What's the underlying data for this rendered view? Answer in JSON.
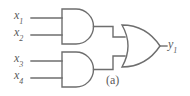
{
  "figure": {
    "caption": "(a)",
    "caption_x": 106,
    "caption_y": 74,
    "width": 190,
    "height": 96,
    "background_color": "#ffffff",
    "line_color": "#6e6e6e",
    "text_color": "#5a5a5a"
  },
  "inputs": [
    {
      "name": "x1",
      "base": "x",
      "subscript": "1",
      "x": 14,
      "y": 9,
      "wire_y": 18,
      "wire_x1": 31,
      "wire_x2": 61
    },
    {
      "name": "x2",
      "base": "x",
      "subscript": "2",
      "x": 14,
      "y": 26,
      "wire_y": 35,
      "wire_x1": 31,
      "wire_x2": 61
    },
    {
      "name": "x3",
      "base": "x",
      "subscript": "3",
      "x": 14,
      "y": 52,
      "wire_y": 61,
      "wire_x1": 31,
      "wire_x2": 61
    },
    {
      "name": "x4",
      "base": "x",
      "subscript": "4",
      "x": 14,
      "y": 69,
      "wire_y": 78,
      "wire_x1": 31,
      "wire_x2": 61
    }
  ],
  "outputs": [
    {
      "name": "y1",
      "base": "y",
      "subscript": "1",
      "x": 168,
      "y": 38,
      "wire_y": 46,
      "wire_x1": 160,
      "wire_x2": 167
    }
  ],
  "gates": [
    {
      "id": "and-gate-top",
      "type": "AND",
      "label": "AND",
      "x": 61,
      "y": 9,
      "width": 32,
      "height": 35,
      "output_x": 93,
      "output_y": 26
    },
    {
      "id": "and-gate-bottom",
      "type": "AND",
      "label": "AND",
      "x": 61,
      "y": 52,
      "width": 32,
      "height": 35,
      "output_x": 93,
      "output_y": 69
    },
    {
      "id": "or-gate",
      "type": "OR",
      "label": "OR",
      "x": 122,
      "y": 25,
      "width": 38,
      "height": 42,
      "output_x": 160,
      "output_y": 46
    }
  ],
  "wires": [
    {
      "id": "wire-and-top-to-or",
      "points": "93,26 113,26 113,37 124,37"
    },
    {
      "id": "wire-and-bottom-to-or",
      "points": "93,69 113,69 113,56 124,56"
    }
  ]
}
